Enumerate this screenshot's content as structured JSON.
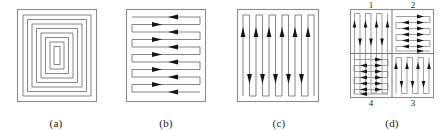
{
  "figure": {
    "background_color": "#ffffff",
    "line_color": "#6f6f6f",
    "frame_color": "#8d8d8d",
    "arrow_color": "#161616",
    "panel_count": 4
  },
  "panels": [
    {
      "id": "a",
      "caption": "(a)",
      "pattern_name": "inward-square-spiral",
      "description": "Concentric square spiral path from outer boundary to center",
      "ring_count": 8,
      "arrows": 0,
      "orientation": "spiral"
    },
    {
      "id": "b",
      "caption": "(b)",
      "pattern_name": "horizontal-boustrophedon",
      "description": "Horizontal back-and-forth raster sweep with directional arrows",
      "sweep_count": 6,
      "arrows": 12,
      "orientation": "horizontal"
    },
    {
      "id": "c",
      "caption": "(c)",
      "pattern_name": "vertical-boustrophedon",
      "description": "Vertical back-and-forth raster sweep with directional arrows",
      "sweep_count": 6,
      "arrows": 11,
      "orientation": "vertical"
    },
    {
      "id": "d",
      "caption": "(d)",
      "pattern_name": "quadrant-decomposition",
      "description": "Area divided into four sub-regions with alternating sweep orientations, traversed in numbered order",
      "quadrant_count": 4,
      "quadrants": [
        {
          "number": "1",
          "position": "top-left",
          "orientation": "vertical",
          "sweep_count": 7
        },
        {
          "number": "2",
          "position": "top-right",
          "orientation": "horizontal",
          "sweep_count": 6
        },
        {
          "number": "3",
          "position": "bottom-right",
          "orientation": "vertical",
          "sweep_count": 7
        },
        {
          "number": "4",
          "position": "bottom-left",
          "orientation": "horizontal",
          "sweep_count": 6
        }
      ]
    }
  ]
}
